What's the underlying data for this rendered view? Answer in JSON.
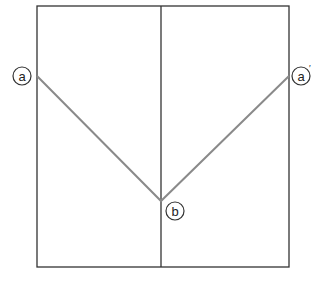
{
  "diagram": {
    "labels": {
      "left_point": "a",
      "right_point": "a'",
      "vertex_point": "b"
    },
    "colors": {
      "frame": "#333333",
      "fold_line": "#8a8a8a"
    }
  }
}
